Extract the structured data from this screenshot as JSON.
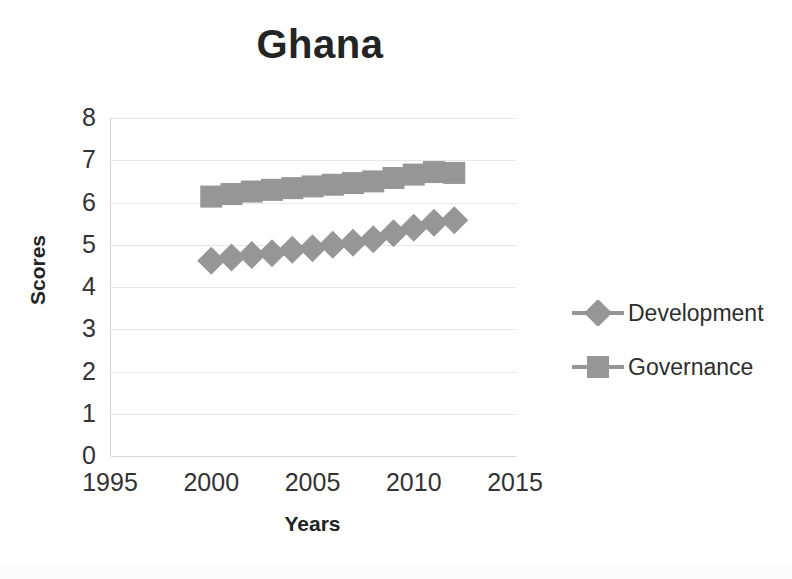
{
  "chart_data": {
    "type": "line",
    "title": "Ghana",
    "xlabel": "Years",
    "ylabel": "Scores",
    "xlim": [
      1995,
      2015
    ],
    "ylim": [
      0,
      8
    ],
    "xticks": [
      "1995",
      "2000",
      "2005",
      "2010",
      "2015"
    ],
    "yticks": [
      "0",
      "1",
      "2",
      "3",
      "4",
      "5",
      "6",
      "7",
      "8"
    ],
    "grid": true,
    "legend_position": "right",
    "x": [
      2000,
      2001,
      2002,
      2003,
      2004,
      2005,
      2006,
      2007,
      2008,
      2009,
      2010,
      2011,
      2012
    ],
    "series": [
      {
        "name": "Development",
        "marker": "diamond",
        "color": "#969696",
        "values": [
          4.62,
          4.7,
          4.76,
          4.8,
          4.88,
          4.92,
          5.0,
          5.05,
          5.13,
          5.27,
          5.4,
          5.52,
          5.58
        ]
      },
      {
        "name": "Governance",
        "marker": "square",
        "color": "#969696",
        "values": [
          6.14,
          6.2,
          6.26,
          6.3,
          6.34,
          6.38,
          6.42,
          6.46,
          6.5,
          6.58,
          6.66,
          6.72,
          6.7
        ]
      }
    ]
  },
  "legend": {
    "entries": [
      {
        "label": "Development",
        "marker": "diamond-marker-icon"
      },
      {
        "label": "Governance",
        "marker": "square-marker-icon"
      }
    ]
  }
}
